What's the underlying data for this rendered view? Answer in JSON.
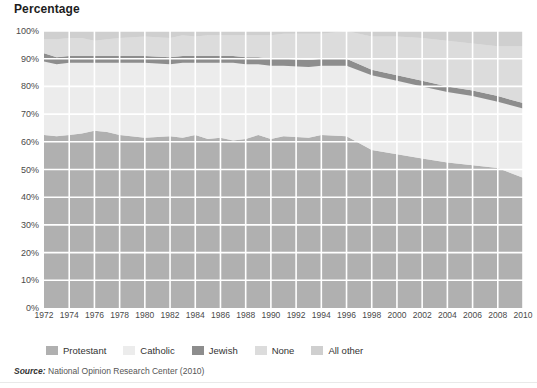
{
  "chart_title": "Percentage",
  "source": {
    "label": "Source:",
    "text": "National Opinion Research Center (2010)"
  },
  "axes": {
    "y_ticks": [
      "0%",
      "10%",
      "20%",
      "30%",
      "40%",
      "50%",
      "60%",
      "70%",
      "80%",
      "90%",
      "100%"
    ],
    "y_values": [
      0,
      10,
      20,
      30,
      40,
      50,
      60,
      70,
      80,
      90,
      100
    ],
    "x_ticks": [
      "1972",
      "1974",
      "1976",
      "1978",
      "1980",
      "1982",
      "1984",
      "1986",
      "1988",
      "1990",
      "1992",
      "1994",
      "1996",
      "1998",
      "2000",
      "2002",
      "2004",
      "2006",
      "2008",
      "2010"
    ]
  },
  "colors": {
    "protestant": "#b0b0b0",
    "catholic": "#ececec",
    "jewish": "#8d8d8d",
    "none": "#dcdcdc",
    "all_other": "#cfcfcf",
    "grid": "#ffffff",
    "plot_bg": "#e8e8e8",
    "text": "#4a4a4a"
  },
  "chart_data": {
    "type": "area",
    "stacked": true,
    "title": "Percentage",
    "xlabel": "",
    "ylabel": "Percentage",
    "ylim": [
      0,
      100
    ],
    "xlim": [
      1972,
      2010
    ],
    "grid": true,
    "legend_position": "bottom",
    "categories": [
      1972,
      1973,
      1974,
      1975,
      1976,
      1977,
      1978,
      1980,
      1982,
      1983,
      1984,
      1985,
      1986,
      1987,
      1988,
      1989,
      1990,
      1991,
      1993,
      1994,
      1996,
      1998,
      2000,
      2002,
      2004,
      2006,
      2008,
      2010
    ],
    "series": [
      {
        "name": "Protestant",
        "color": "#b0b0b0",
        "values": [
          62.5,
          62.0,
          62.5,
          63.0,
          64.0,
          63.5,
          62.5,
          61.5,
          62.0,
          61.5,
          62.5,
          61.0,
          61.5,
          60.5,
          61.0,
          62.5,
          61.0,
          62.0,
          61.5,
          62.5,
          62.0,
          57.0,
          55.5,
          54.0,
          52.5,
          51.5,
          50.5,
          47.0
        ]
      },
      {
        "name": "Catholic",
        "color": "#ececec",
        "values": [
          26.5,
          26.0,
          26.0,
          25.5,
          24.5,
          25.0,
          26.0,
          27.0,
          26.0,
          27.0,
          26.0,
          27.5,
          27.0,
          28.0,
          27.0,
          25.5,
          26.5,
          25.5,
          25.5,
          25.0,
          25.5,
          27.0,
          26.5,
          26.0,
          25.5,
          25.0,
          24.0,
          25.0
        ]
      },
      {
        "name": "Jewish",
        "color": "#8d8d8d",
        "values": [
          3.0,
          2.5,
          2.5,
          2.5,
          2.5,
          2.5,
          2.5,
          2.5,
          2.5,
          2.5,
          2.5,
          2.5,
          2.5,
          2.5,
          2.5,
          2.5,
          2.5,
          2.5,
          2.5,
          2.5,
          2.5,
          2.0,
          2.0,
          2.0,
          2.0,
          2.0,
          2.0,
          2.0
        ]
      },
      {
        "name": "None",
        "color": "#dcdcdc",
        "values": [
          5.0,
          6.5,
          6.5,
          6.5,
          5.5,
          6.0,
          6.5,
          7.0,
          7.0,
          7.5,
          7.0,
          7.5,
          7.5,
          7.5,
          8.0,
          8.0,
          8.5,
          9.0,
          9.5,
          9.0,
          10.0,
          12.0,
          14.0,
          15.5,
          16.5,
          17.0,
          18.0,
          20.5
        ]
      },
      {
        "name": "All other",
        "color": "#cfcfcf",
        "values": [
          3.0,
          3.0,
          2.5,
          2.5,
          3.5,
          3.0,
          2.5,
          2.0,
          2.5,
          1.5,
          2.0,
          1.5,
          1.5,
          1.5,
          2.0,
          1.5,
          1.5,
          1.0,
          1.0,
          1.0,
          0.0,
          2.0,
          2.0,
          2.5,
          3.5,
          4.5,
          5.5,
          5.5
        ]
      }
    ],
    "legend": [
      "Protestant",
      "Catholic",
      "Jewish",
      "None",
      "All other"
    ]
  }
}
